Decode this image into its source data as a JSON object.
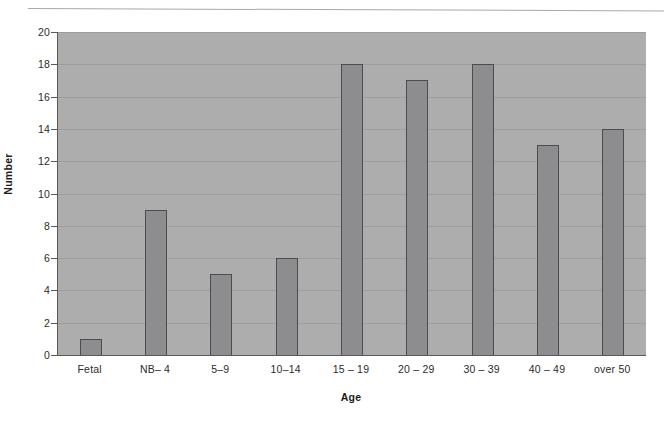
{
  "chart_data": {
    "type": "bar",
    "title": "",
    "subtitle": "",
    "xlabel": "Age",
    "ylabel": "Number",
    "categories": [
      "Fetal",
      "NB– 4",
      "5–9",
      "10–14",
      "15 – 19",
      "20 – 29",
      "30 – 39",
      "40 – 49",
      "over 50"
    ],
    "values": [
      1,
      9,
      5,
      6,
      18,
      17,
      18,
      13,
      14
    ],
    "ylim": [
      0,
      20
    ],
    "ytick_step": 2,
    "ytick_labels": [
      "0",
      "2",
      "4",
      "6",
      "8",
      "10",
      "12",
      "14",
      "16",
      "18",
      "20"
    ],
    "grid": true,
    "legend": false,
    "legend_position": "none",
    "annotations": []
  },
  "style": {
    "plot_background": "#adadad",
    "bar_fill": "#8d8d8f",
    "bar_border": "#4c4c4e",
    "gridline_color": "#9d9d9d",
    "axis_color": "#59595b",
    "text_color": "#2b2b2b",
    "page_background": "#ffffff"
  }
}
